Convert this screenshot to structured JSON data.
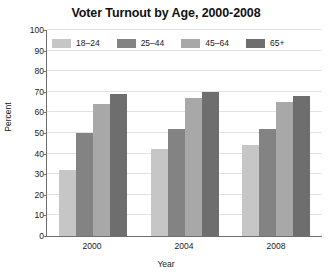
{
  "chart_data": {
    "type": "bar",
    "title": "Voter Turnout by Age, 2000-2008",
    "xlabel": "Year",
    "ylabel": "Percent",
    "categories": [
      "2000",
      "2004",
      "2008"
    ],
    "series": [
      {
        "name": "18–24",
        "color": "#c6c6c6",
        "values": [
          32,
          42,
          44
        ]
      },
      {
        "name": "25–44",
        "color": "#838383",
        "values": [
          50,
          52,
          52
        ]
      },
      {
        "name": "45–64",
        "color": "#a8a8a8",
        "values": [
          64,
          67,
          65
        ]
      },
      {
        "name": "65+",
        "color": "#6e6e6e",
        "values": [
          69,
          70,
          68
        ]
      }
    ],
    "ylim": [
      0,
      100
    ],
    "yticks": [
      0,
      10,
      20,
      30,
      40,
      50,
      60,
      70,
      80,
      90,
      100
    ],
    "grid": true,
    "legend_position": "top-inside"
  }
}
